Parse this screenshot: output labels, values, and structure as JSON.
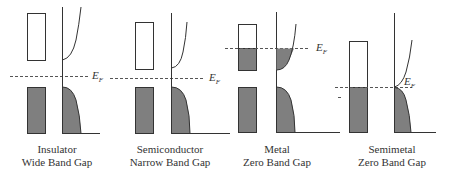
{
  "diagram": {
    "fermi_label": "E",
    "fermi_sub": "F",
    "colors": {
      "fill": "#7f7f7f",
      "line": "#333333",
      "background": "#ffffff"
    },
    "panels": [
      {
        "id": "insulator",
        "name": "Insulator",
        "gap": "Wide Band Gap"
      },
      {
        "id": "semiconductor",
        "name": "Semiconductor",
        "gap": "Narrow Band Gap"
      },
      {
        "id": "metal",
        "name": "Metal",
        "gap": "Zero Band Gap"
      },
      {
        "id": "semimetal",
        "name": "Semimetal",
        "gap": "Zero Band Gap"
      }
    ]
  }
}
